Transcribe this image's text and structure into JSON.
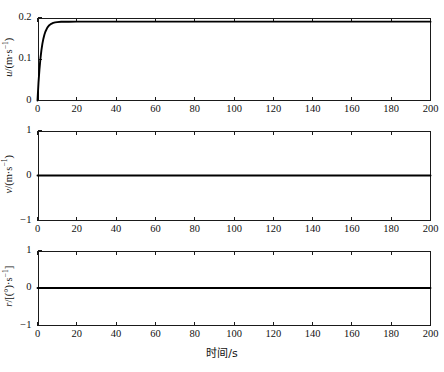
{
  "figure": {
    "background": "#ffffff",
    "line_color": "#000000",
    "axis_color": "#1a1a1a"
  },
  "xaxis": {
    "label": "时间/s",
    "ticks": [
      0,
      20,
      40,
      60,
      80,
      100,
      120,
      140,
      160,
      180,
      200
    ],
    "tick_labels": [
      "0",
      "20",
      "40",
      "60",
      "80",
      "100",
      "120",
      "140",
      "160",
      "180",
      "200"
    ],
    "min": 0,
    "max": 200
  },
  "panels": [
    {
      "name": "surge-velocity-panel",
      "ylabel_parts": {
        "var": "u",
        "unit_open": "/(m·s",
        "exp": "−1",
        "unit_close": ")"
      },
      "ylabel_text": "u/(m·s−1)",
      "yticks": [
        0,
        0.1,
        0.2
      ],
      "ytick_labels": [
        "0",
        "0.1",
        "0.2"
      ],
      "ymin": 0,
      "ymax": 0.2
    },
    {
      "name": "sway-velocity-panel",
      "ylabel_parts": {
        "var": "v",
        "unit_open": "/(m·s",
        "exp": "−1",
        "unit_close": ")"
      },
      "ylabel_text": "v/(m·s−1)",
      "yticks": [
        -1,
        0,
        1
      ],
      "ytick_labels": [
        "−1",
        "0",
        "1"
      ],
      "ymin": -1,
      "ymax": 1
    },
    {
      "name": "yaw-rate-panel",
      "ylabel_parts": {
        "var": "r",
        "unit_open": "/[(°)·s",
        "exp": "−1",
        "unit_close": "]"
      },
      "ylabel_text": "r/[(°)·s−1]",
      "yticks": [
        -1,
        0,
        1
      ],
      "ytick_labels": [
        "−1",
        "0",
        "1"
      ],
      "ymin": -1,
      "ymax": 1
    }
  ],
  "chart_data": [
    {
      "type": "line",
      "title": "",
      "xlabel": "时间/s",
      "ylabel": "u/(m·s−1)",
      "xlim": [
        0,
        200
      ],
      "ylim": [
        0,
        0.2
      ],
      "grid": false,
      "legend": "none",
      "x": [
        0,
        0.5,
        1,
        1.5,
        2,
        2.5,
        3,
        3.5,
        4,
        5,
        6,
        7,
        8,
        9,
        10,
        12,
        14,
        16,
        20,
        30,
        40,
        60,
        80,
        100,
        120,
        140,
        160,
        180,
        200
      ],
      "y": [
        0,
        0.0425,
        0.0755,
        0.1013,
        0.1213,
        0.1369,
        0.149,
        0.1584,
        0.1657,
        0.1757,
        0.1815,
        0.1849,
        0.187,
        0.1882,
        0.1889,
        0.1896,
        0.1898,
        0.1899,
        0.19,
        0.19,
        0.19,
        0.19,
        0.19,
        0.19,
        0.19,
        0.19,
        0.19,
        0.19,
        0.19
      ],
      "description": "First-order exponential rise from 0 to steady-state 0.165 m/s with time constant ~2.5 s"
    },
    {
      "type": "line",
      "title": "",
      "xlabel": "时间/s",
      "ylabel": "v/(m·s−1)",
      "xlim": [
        0,
        200
      ],
      "ylim": [
        -1,
        1
      ],
      "grid": false,
      "legend": "none",
      "x": [
        0,
        200
      ],
      "y": [
        0,
        0
      ],
      "description": "Constant zero sway velocity"
    },
    {
      "type": "line",
      "title": "",
      "xlabel": "时间/s",
      "ylabel": "r/[(°)·s−1]",
      "xlim": [
        0,
        200
      ],
      "ylim": [
        -1,
        1
      ],
      "grid": false,
      "legend": "none",
      "x": [
        0,
        200
      ],
      "y": [
        0,
        0
      ],
      "description": "Constant zero yaw rate"
    }
  ]
}
